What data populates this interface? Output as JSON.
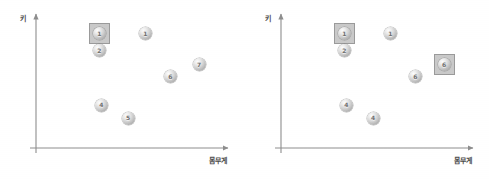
{
  "chart_data": [
    {
      "type": "scatter",
      "title": "",
      "xlabel": "몸무게",
      "ylabel": "키",
      "xlim": [
        0,
        100
      ],
      "ylim": [
        0,
        100
      ],
      "grid": false,
      "legend": "none",
      "axis_style": "arrow",
      "points": [
        {
          "label": "1",
          "x": 33,
          "y": 88,
          "highlighted": true
        },
        {
          "label": "1",
          "x": 57,
          "y": 88,
          "highlighted": false
        },
        {
          "label": "2",
          "x": 33,
          "y": 75,
          "highlighted": false
        },
        {
          "label": "7",
          "x": 85,
          "y": 64,
          "highlighted": false
        },
        {
          "label": "6",
          "x": 70,
          "y": 55,
          "highlighted": false
        },
        {
          "label": "4",
          "x": 34,
          "y": 33,
          "highlighted": false
        },
        {
          "label": "5",
          "x": 48,
          "y": 23,
          "highlighted": false
        }
      ]
    },
    {
      "type": "scatter",
      "title": "",
      "xlabel": "몸무게",
      "ylabel": "키",
      "xlim": [
        0,
        100
      ],
      "ylim": [
        0,
        100
      ],
      "grid": false,
      "legend": "none",
      "axis_style": "arrow",
      "points": [
        {
          "label": "1",
          "x": 33,
          "y": 88,
          "highlighted": true
        },
        {
          "label": "1",
          "x": 57,
          "y": 88,
          "highlighted": false
        },
        {
          "label": "2",
          "x": 33,
          "y": 75,
          "highlighted": false
        },
        {
          "label": "6",
          "x": 85,
          "y": 64,
          "highlighted": true
        },
        {
          "label": "6",
          "x": 70,
          "y": 55,
          "highlighted": false
        },
        {
          "label": "4",
          "x": 34,
          "y": 33,
          "highlighted": false
        },
        {
          "label": "4",
          "x": 48,
          "y": 23,
          "highlighted": false
        }
      ]
    }
  ],
  "colors": {
    "axis": "#8d8d8d",
    "label_text": "#4a4a4a",
    "marker_fill": "#d2d2d2",
    "marker_text": "#6e6e6e",
    "highlight_fill": "#c9c9c9",
    "highlight_border": "#9a9a9a",
    "background": "#ffffff"
  }
}
